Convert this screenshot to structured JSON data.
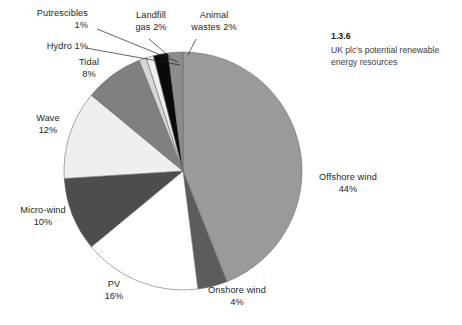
{
  "figure": {
    "caption_number": "1.3.6",
    "caption_text": "UK plc's potential renewable energy resources"
  },
  "labels": {
    "putrescibles": "Putrescibles\n1%",
    "hydro": "Hydro 1%",
    "tidal": "Tidal\n8%",
    "wave": "Wave\n12%",
    "microwind": "Micro-wind\n10%",
    "pv": "PV\n16%",
    "onshore": "Onshore wind\n4%",
    "offshore": "Offshore wind\n44%",
    "landfill": "Landfill\ngas 2%",
    "animal": "Animal\nwastes 2%"
  },
  "chart_data": {
    "type": "pie",
    "title": "UK plc's potential renewable energy resources",
    "categories": [
      "Offshore wind",
      "Onshore wind",
      "PV",
      "Micro-wind",
      "Wave",
      "Tidal",
      "Hydro",
      "Putrescibles",
      "Landfill gas",
      "Animal wastes"
    ],
    "values": [
      44,
      4,
      16,
      10,
      12,
      8,
      1,
      1,
      2,
      2
    ],
    "units": "percent",
    "value_labels": [
      "44%",
      "4%",
      "16%",
      "10%",
      "12%",
      "8%",
      "1%",
      "1%",
      "2%",
      "2%"
    ],
    "colors": [
      "#9a9a9a",
      "#5c5c5c",
      "#ffffff",
      "#4d4d4d",
      "#efefef",
      "#808080",
      "#d6d6d6",
      "#efefef",
      "#0a0a0a",
      "#8c8c8c"
    ],
    "start_angle_deg": 0,
    "direction": "clockwise",
    "legend": "none",
    "grid": false,
    "labels_position": "outside-with-leader-lines"
  }
}
